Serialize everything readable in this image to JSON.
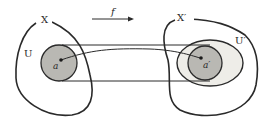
{
  "diagram": {
    "colors": {
      "stroke": "#2a2a2a",
      "disk_fill": "#b9b8b3",
      "neighbourhood_fill": "#eeede8",
      "background": "#ffffff"
    },
    "labels": {
      "map": "f",
      "domain_space": "X",
      "domain_neighbourhood": "U",
      "domain_point": "a",
      "codomain_space": "X′",
      "codomain_neighbourhood": "U′",
      "codomain_point": "a′"
    },
    "nodes": [
      {
        "id": "X",
        "label": "X",
        "kind": "space-region"
      },
      {
        "id": "U",
        "label": "U",
        "kind": "shaded-disk"
      },
      {
        "id": "a",
        "label": "a",
        "kind": "point"
      },
      {
        "id": "X'",
        "label": "X′",
        "kind": "space-region"
      },
      {
        "id": "U'",
        "label": "U′",
        "kind": "neighbourhood-ellipse"
      },
      {
        "id": "f(U)",
        "label": "",
        "kind": "shaded-disk"
      },
      {
        "id": "a'",
        "label": "a′",
        "kind": "point"
      }
    ],
    "edges": [
      {
        "from": "X",
        "to": "X'",
        "label": "f",
        "kind": "arrow"
      },
      {
        "from": "a",
        "to": "a'",
        "label": "",
        "kind": "curve"
      },
      {
        "from": "U",
        "to": "f(U)",
        "label": "",
        "kind": "tangent-lines"
      }
    ]
  }
}
